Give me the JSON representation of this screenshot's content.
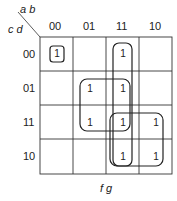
{
  "kmap": {
    "corner": {
      "col_vars": "a b",
      "row_vars": "c d"
    },
    "column_headers": [
      "00",
      "01",
      "11",
      "10"
    ],
    "row_headers": [
      "00",
      "01",
      "11",
      "10"
    ],
    "cells": [
      [
        "1",
        "",
        "1",
        ""
      ],
      [
        "",
        "1",
        "1",
        ""
      ],
      [
        "",
        "1",
        "1",
        "1"
      ],
      [
        "",
        "",
        "1",
        "1"
      ]
    ],
    "bottom_label": "f g",
    "groups": [
      {
        "name": "single-00-00",
        "rows": [
          0
        ],
        "cols": [
          0
        ]
      },
      {
        "name": "col-11-vertical",
        "rows": [
          0,
          1,
          2,
          3
        ],
        "cols": [
          2
        ]
      },
      {
        "name": "quad-01-11",
        "rows": [
          1,
          2
        ],
        "cols": [
          1,
          2
        ]
      },
      {
        "name": "quad-11-10",
        "rows": [
          2,
          3
        ],
        "cols": [
          2,
          3
        ]
      }
    ],
    "colors": {
      "line": "#333333",
      "loop": "#222222",
      "text": "#222222"
    }
  }
}
